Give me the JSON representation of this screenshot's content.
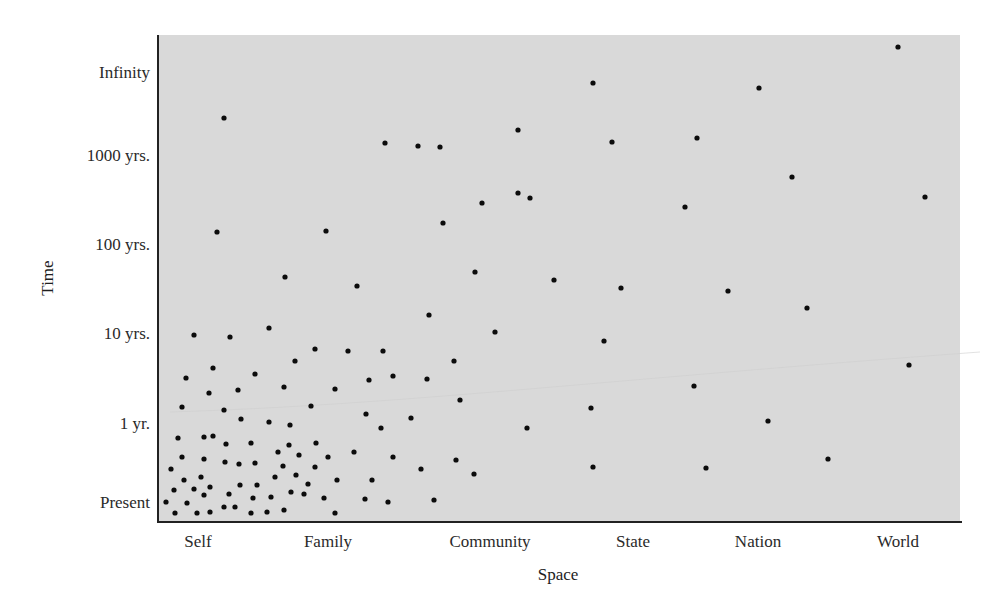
{
  "chart_data": {
    "type": "scatter",
    "title": "",
    "xlabel": "Space",
    "ylabel": "Time",
    "x_categories": [
      "Self",
      "Family",
      "Community",
      "State",
      "Nation",
      "World"
    ],
    "y_categories": [
      "Present",
      "1 yr.",
      "10 yrs.",
      "100 yrs.",
      "1000 yrs.",
      "Infinity"
    ],
    "grid": false,
    "legend": null,
    "background": "#d9d9d9",
    "dot_color": "#0c0c0c",
    "plot_box_px": {
      "left": 158,
      "right": 960,
      "top": 35,
      "bottom": 522
    },
    "x_tick_px": [
      198,
      328,
      490,
      633,
      758,
      898
    ],
    "y_tick_px": [
      502,
      423,
      333,
      244,
      155,
      72
    ],
    "note": "Points given in pixel coordinates of the figure; x maps to Space categories, y to Time categories (log-like scale).",
    "points_px": [
      [
        166,
        502
      ],
      [
        171,
        469
      ],
      [
        174,
        490
      ],
      [
        175,
        513
      ],
      [
        178,
        438
      ],
      [
        182,
        457
      ],
      [
        184,
        480
      ],
      [
        187,
        503
      ],
      [
        194,
        489
      ],
      [
        197,
        513
      ],
      [
        201,
        477
      ],
      [
        204,
        437
      ],
      [
        204,
        459
      ],
      [
        204,
        495
      ],
      [
        210,
        487
      ],
      [
        210,
        512
      ],
      [
        213,
        436
      ],
      [
        224,
        507
      ],
      [
        225,
        462
      ],
      [
        226,
        444
      ],
      [
        229,
        494
      ],
      [
        235,
        507
      ],
      [
        239,
        464
      ],
      [
        240,
        485
      ],
      [
        251,
        443
      ],
      [
        251,
        513
      ],
      [
        253,
        498
      ],
      [
        255,
        463
      ],
      [
        257,
        485
      ],
      [
        267,
        512
      ],
      [
        271,
        497
      ],
      [
        275,
        477
      ],
      [
        278,
        452
      ],
      [
        283,
        466
      ],
      [
        284,
        510
      ],
      [
        289,
        445
      ],
      [
        291,
        492
      ],
      [
        296,
        475
      ],
      [
        299,
        455
      ],
      [
        304,
        494
      ],
      [
        308,
        484
      ],
      [
        315,
        467
      ],
      [
        316,
        443
      ],
      [
        324,
        498
      ],
      [
        328,
        457
      ],
      [
        335,
        513
      ],
      [
        337,
        480
      ],
      [
        354,
        452
      ],
      [
        182,
        407
      ],
      [
        186,
        378
      ],
      [
        194,
        335
      ],
      [
        209,
        393
      ],
      [
        213,
        368
      ],
      [
        224,
        410
      ],
      [
        230,
        337
      ],
      [
        238,
        390
      ],
      [
        241,
        419
      ],
      [
        255,
        374
      ],
      [
        269,
        328
      ],
      [
        269,
        422
      ],
      [
        284,
        387
      ],
      [
        290,
        425
      ],
      [
        295,
        361
      ],
      [
        311,
        406
      ],
      [
        315,
        349
      ],
      [
        335,
        389
      ],
      [
        348,
        351
      ],
      [
        366,
        414
      ],
      [
        369,
        380
      ],
      [
        381,
        428
      ],
      [
        383,
        351
      ],
      [
        393,
        376
      ],
      [
        411,
        418
      ],
      [
        421,
        469
      ],
      [
        427,
        379
      ],
      [
        434,
        500
      ],
      [
        454,
        361
      ],
      [
        456,
        460
      ],
      [
        460,
        400
      ],
      [
        474,
        474
      ],
      [
        365,
        499
      ],
      [
        388,
        502
      ],
      [
        372,
        480
      ],
      [
        393,
        457
      ],
      [
        224,
        118
      ],
      [
        217,
        232
      ],
      [
        326,
        231
      ],
      [
        285,
        277
      ],
      [
        357,
        286
      ],
      [
        429,
        315
      ],
      [
        385,
        143
      ],
      [
        418,
        146
      ],
      [
        440,
        147
      ],
      [
        443,
        223
      ],
      [
        482,
        203
      ],
      [
        518,
        193
      ],
      [
        530,
        198
      ],
      [
        518,
        130
      ],
      [
        475,
        272
      ],
      [
        554,
        280
      ],
      [
        495,
        332
      ],
      [
        527,
        428
      ],
      [
        593,
        83
      ],
      [
        612,
        142
      ],
      [
        697,
        138
      ],
      [
        685,
        207
      ],
      [
        759,
        88
      ],
      [
        621,
        288
      ],
      [
        728,
        291
      ],
      [
        807,
        308
      ],
      [
        604,
        341
      ],
      [
        694,
        386
      ],
      [
        591,
        408
      ],
      [
        768,
        421
      ],
      [
        593,
        467
      ],
      [
        706,
        468
      ],
      [
        828,
        459
      ],
      [
        898,
        47
      ],
      [
        792,
        177
      ],
      [
        925,
        197
      ],
      [
        909,
        365
      ]
    ]
  }
}
